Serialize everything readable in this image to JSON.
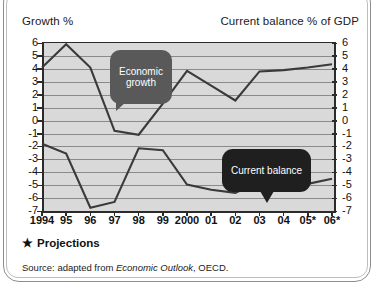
{
  "frame": {
    "caption_left": "Growth %",
    "caption_right": "Current balance % of GDP",
    "footnote_star": "★",
    "footnote_text": "Projections",
    "source_prefix": "Source: adapted from ",
    "source_italic": "Economic Outlook",
    "source_suffix": ", OECD."
  },
  "labels": {
    "bubble_growth": "Economic\ngrowth",
    "bubble_balance": "Current balance"
  },
  "chart_data": {
    "type": "line",
    "title": "",
    "xlabel": "",
    "ylabel": "Growth %",
    "y2label": "Current balance % of GDP",
    "grid": true,
    "legend_position": "inline-callouts",
    "categories": [
      "1994",
      "95",
      "96",
      "97",
      "98",
      "99",
      "2000",
      "01",
      "02",
      "03",
      "04",
      "05*",
      "06*"
    ],
    "ylim": [
      -7,
      6
    ],
    "yticks": [
      6,
      5,
      4,
      3,
      2,
      1,
      0,
      -1,
      -2,
      -3,
      -4,
      -5,
      -6,
      -7
    ],
    "y2lim": [
      -7,
      6
    ],
    "y2ticks": [
      6,
      5,
      4,
      3,
      2,
      1,
      0,
      -1,
      -2,
      -3,
      -4,
      -5,
      -6,
      -7
    ],
    "series": [
      {
        "name": "Economic growth",
        "axis": "left",
        "values": [
          4.1,
          5.9,
          4.1,
          -0.8,
          -1.1,
          1.3,
          3.85,
          2.7,
          1.55,
          3.8,
          3.9,
          4.1,
          4.35
        ]
      },
      {
        "name": "Current balance",
        "axis": "right",
        "values": [
          -1.8,
          -2.55,
          -6.75,
          -6.3,
          -2.15,
          -2.3,
          -4.95,
          -5.35,
          -5.6,
          -4.7,
          -5.15,
          -4.9,
          -4.5
        ]
      }
    ]
  },
  "colors": {
    "plot_background": "#d9d9d9",
    "gridline": "#8a8a8a",
    "axis": "#2b2b2b",
    "line": "#3a3a3a",
    "bubble_growth": "#595959",
    "bubble_balance": "#1f1f1f",
    "frame_border": "#8e8e8e"
  }
}
